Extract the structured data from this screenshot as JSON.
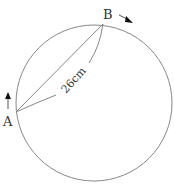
{
  "diagram": {
    "type": "circle-geometry",
    "circle": {
      "cx": 94,
      "cy": 103,
      "r": 78,
      "stroke": "#888888"
    },
    "points": [
      {
        "id": "A",
        "label": "A",
        "x": 16,
        "y": 112
      },
      {
        "id": "B",
        "label": "B",
        "x": 103,
        "y": 24
      }
    ],
    "chord": {
      "from": "A",
      "to": "B",
      "length_label": "26cm"
    },
    "arrows": [
      {
        "at": "A",
        "direction": "up",
        "meaning": "motion direction at A"
      },
      {
        "at": "B",
        "direction": "down-right",
        "meaning": "motion direction at B"
      }
    ],
    "colors": {
      "line": "#888888",
      "text": "#333333",
      "arrow": "#111111"
    }
  }
}
